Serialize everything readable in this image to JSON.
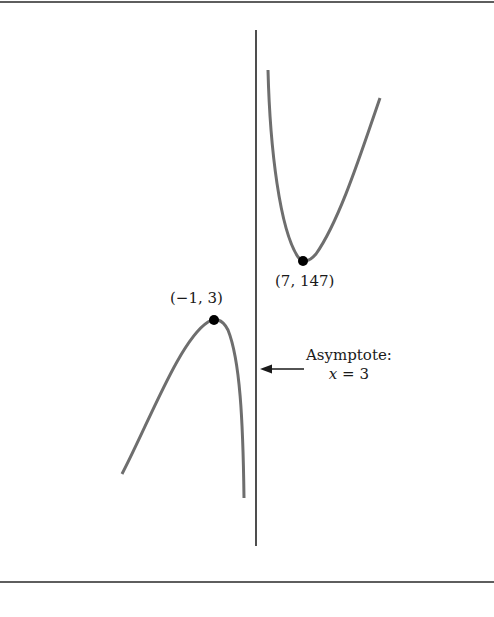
{
  "figure": {
    "type": "graph-with-asymptote",
    "colors": {
      "curve": "#6e6e6e",
      "asymptote": "#222222",
      "point": "#000000",
      "frame": "#5e5e5e"
    }
  },
  "points": {
    "local_max": {
      "label": "(−1, 3)",
      "x": -1,
      "y": 3
    },
    "local_min": {
      "label": "(7, 147)",
      "x": 7,
      "y": 147
    }
  },
  "asymptote": {
    "title": "Asymptote:",
    "var": "x",
    "equals": " = 3",
    "value": 3
  }
}
